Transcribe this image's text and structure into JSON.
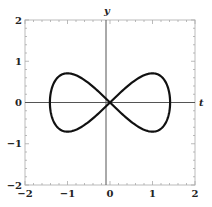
{
  "chart_data": {
    "type": "line",
    "title": "",
    "xlabel": "t",
    "ylabel": "y",
    "xlim": [
      -2,
      2
    ],
    "ylim": [
      -2,
      2
    ],
    "grid": false,
    "frame": true,
    "x_ticks": [
      -2,
      -1,
      0,
      1,
      2
    ],
    "y_ticks": [
      -2,
      -1,
      0,
      1,
      2
    ],
    "x_tick_labels": [
      "-2",
      "-1",
      "0",
      "1",
      "2"
    ],
    "y_tick_labels": [
      "-2",
      "-1",
      "0",
      "1",
      "2"
    ],
    "series": [
      {
        "name": "figure-eight curve",
        "parametric": "x = sqrt(2) cos(s), y = (sqrt(2)/2) sin(2s)",
        "color": "#111111",
        "key_points": [
          {
            "x": 1.414,
            "y": 0
          },
          {
            "x": 1.0,
            "y": 0.707
          },
          {
            "x": 0,
            "y": 0
          },
          {
            "x": -1.0,
            "y": 0.707
          },
          {
            "x": -1.414,
            "y": 0
          },
          {
            "x": -1.0,
            "y": -0.707
          },
          {
            "x": 1.0,
            "y": -0.707
          }
        ]
      }
    ]
  },
  "axes": {
    "x_label": "t",
    "y_label": "y",
    "x_ticks": [
      "-2",
      "-1",
      "0",
      "1",
      "2"
    ],
    "y_ticks": [
      "2",
      "1",
      "0",
      "-1",
      "-2"
    ]
  },
  "colors": {
    "curve": "#111111",
    "axis": "#444444",
    "frame": "#bbbbbb"
  }
}
